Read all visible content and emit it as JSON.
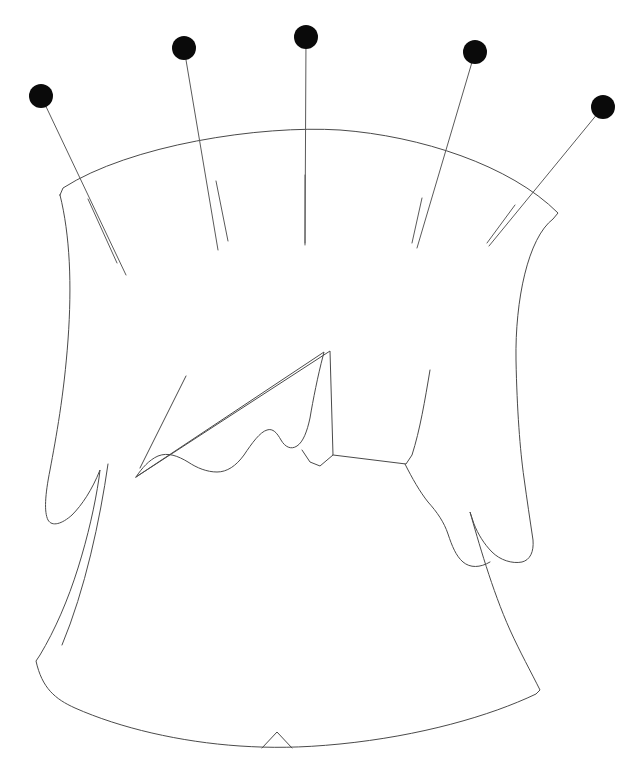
{
  "figure": {
    "kind": "line-drawing",
    "background_color": "#ffffff",
    "stroke_color": "#4a4a4a",
    "pin_head_color": "#0a0a0a",
    "canvas": {
      "width": 631,
      "height": 762
    }
  },
  "pins": [
    {
      "name": "pin-1",
      "head_x": 41,
      "head_y": 96,
      "head_r": 12,
      "tip_x": 126,
      "tip_y": 275
    },
    {
      "name": "pin-2",
      "head_x": 184,
      "head_y": 48,
      "head_r": 12,
      "tip_x": 218,
      "tip_y": 250
    },
    {
      "name": "pin-3",
      "head_x": 306,
      "head_y": 37,
      "head_r": 12,
      "tip_x": 305,
      "tip_y": 245
    },
    {
      "name": "pin-4",
      "head_x": 475,
      "head_y": 52,
      "head_r": 12,
      "tip_x": 417,
      "tip_y": 248
    },
    {
      "name": "pin-5",
      "head_x": 603,
      "head_y": 107,
      "head_r": 12,
      "tip_x": 489,
      "tip_y": 246
    }
  ],
  "outline": {
    "name": "pattern-outline",
    "d": "M 60 195 L 63 188 C 130 145 260 125 340 130 C 420 136 510 165 558 213 L 553 219 C 528 238 515 300 516 360 C 517 410 520 450 524 478 C 527 500 530 520 533 540 C 534 552 530 560 522 562 C 512 564 500 560 492 552 C 484 544 478 534 474 524 L 470 512 C 478 540 492 590 510 630 C 520 652 531 672 540 690 L 536 694 C 490 716 420 736 340 744 C 300 748 270 748 240 746 C 180 742 120 728 75 708 C 55 699 42 688 36 661 L 40 655 C 55 630 68 600 78 568 C 88 536 95 505 99 478 L 100 470 C 92 490 82 505 72 515 C 62 524 52 527 48 520 C 44 512 45 495 50 470 C 56 438 64 395 68 340 C 72 285 70 235 60 195 Z"
  },
  "inner_contour": {
    "name": "inner-seam-contour",
    "d": "M 136 477 L 324 352 L 323 356 C 318 375 313 400 310 418 C 307 432 303 442 297 446 C 291 450 285 447 281 440 C 277 433 273 428 267 430 C 260 432 252 443 244 455 C 236 466 227 472 217 472 C 207 472 197 468 188 462 C 178 456 168 452 158 456 C 149 460 142 468 136 477 Z"
  },
  "fold_line": {
    "name": "fold-crease-line",
    "d": "M 136 477 L 330 351 L 333 455 L 320 466 L 310 462 L 302 450"
  },
  "center_notch": {
    "name": "center-hem-notch",
    "d": "M 262 748 L 277 732 L 292 748"
  },
  "tongue": {
    "name": "lower-tab-tongue",
    "d": "M 405 464 C 412 478 420 492 428 502 C 437 512 444 522 448 534 C 452 546 456 556 463 562 C 470 568 480 568 490 562"
  },
  "inner_lines": [
    {
      "name": "inner-line-right-seam",
      "d": "M 430 370 C 425 400 420 430 412 455 L 406 464 L 333 455"
    },
    {
      "name": "inner-line-left-contour",
      "d": "M 186 376 L 140 468"
    },
    {
      "name": "inner-line-skirt-left-edge",
      "d": "M 108 464 C 100 520 85 590 62 645"
    }
  ],
  "tick_marks": [
    {
      "name": "tick-1",
      "x1": 88,
      "y1": 199,
      "x2": 117,
      "y2": 263
    },
    {
      "name": "tick-2",
      "x1": 216,
      "y1": 181,
      "x2": 228,
      "y2": 241
    },
    {
      "name": "tick-3",
      "x1": 305,
      "y1": 175,
      "x2": 305,
      "y2": 243
    },
    {
      "name": "tick-4",
      "x1": 422,
      "y1": 198,
      "x2": 412,
      "y2": 243
    },
    {
      "name": "tick-5",
      "x1": 515,
      "y1": 205,
      "x2": 487,
      "y2": 243
    }
  ]
}
